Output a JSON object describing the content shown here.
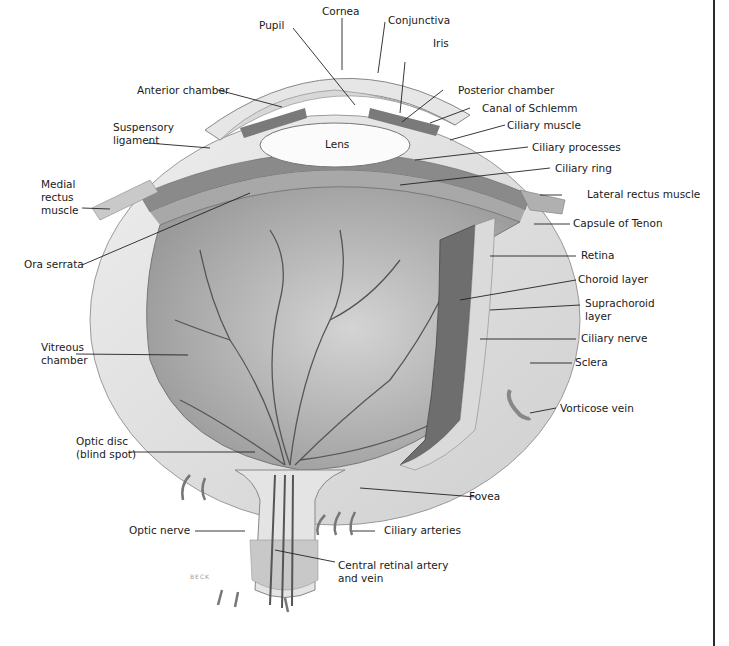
{
  "diagram": {
    "signature": "BECK",
    "colors": {
      "background": "#ffffff",
      "sclera": "#dcdcdc",
      "vitreous": "#b8b8b8",
      "vessels": "#555555",
      "label_text": "#1a1a1a",
      "leader_lines": "#222222",
      "choroid": "#6e6e6e"
    },
    "labels": [
      {
        "id": "cornea",
        "text": "Cornea"
      },
      {
        "id": "conjunctiva",
        "text": "Conjunctiva"
      },
      {
        "id": "pupil",
        "text": "Pupil"
      },
      {
        "id": "iris",
        "text": "Iris"
      },
      {
        "id": "anterior_chamber",
        "text": "Anterior chamber"
      },
      {
        "id": "posterior_chamber",
        "text": "Posterior chamber"
      },
      {
        "id": "canal_of_schlemm",
        "text": "Canal of Schlemm"
      },
      {
        "id": "suspensory_ligament",
        "text": "Suspensory\nligament"
      },
      {
        "id": "lens",
        "text": "Lens"
      },
      {
        "id": "ciliary_muscle",
        "text": "Ciliary muscle"
      },
      {
        "id": "ciliary_processes",
        "text": "Ciliary processes"
      },
      {
        "id": "ciliary_ring",
        "text": "Ciliary ring"
      },
      {
        "id": "medial_rectus_muscle",
        "text": "Medial\nrectus\nmuscle"
      },
      {
        "id": "lateral_rectus_muscle",
        "text": "Lateral rectus muscle"
      },
      {
        "id": "capsule_of_tenon",
        "text": "Capsule of Tenon"
      },
      {
        "id": "ora_serrata",
        "text": "Ora serrata"
      },
      {
        "id": "retina",
        "text": "Retina"
      },
      {
        "id": "choroid_layer",
        "text": "Choroid layer"
      },
      {
        "id": "suprachoroid_layer",
        "text": "Suprachoroid\nlayer"
      },
      {
        "id": "ciliary_nerve",
        "text": "Ciliary nerve"
      },
      {
        "id": "vitreous_chamber",
        "text": "Vitreous\nchamber"
      },
      {
        "id": "sclera",
        "text": "Sclera"
      },
      {
        "id": "vorticose_vein",
        "text": "Vorticose vein"
      },
      {
        "id": "optic_disc",
        "text": "Optic disc\n(blind spot)"
      },
      {
        "id": "fovea",
        "text": "Fovea"
      },
      {
        "id": "optic_nerve",
        "text": "Optic nerve"
      },
      {
        "id": "ciliary_arteries",
        "text": "Ciliary arteries"
      },
      {
        "id": "central_retinal_artery",
        "text": "Central retinal artery\nand vein"
      }
    ]
  }
}
